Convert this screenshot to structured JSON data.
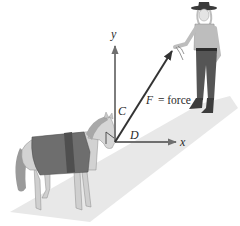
{
  "diagram": {
    "type": "physics-force-diagram",
    "labels": {
      "y_axis": "y",
      "x_axis": "x",
      "vertical_component": "C",
      "horizontal_component": "D",
      "force_symbol": "F",
      "force_equals": "= force"
    },
    "figures": {
      "animal": "pony wearing blanket",
      "person": "woman in cowboy hat holding rope"
    },
    "colors": {
      "axis": "#6f6f6f",
      "force_vector": "#333333",
      "ground": "#e6e6e6",
      "blanket": "#6e6e6e",
      "blanket_band": "#4f4f4f",
      "pony_body": "#d2d2d2",
      "shirt": "#bdbdbd",
      "pants": "#555555",
      "hat": "#3a3a3a"
    }
  }
}
